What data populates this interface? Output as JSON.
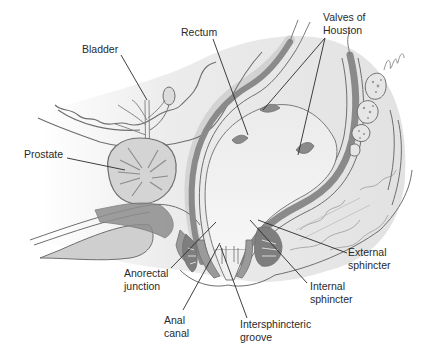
{
  "figure": {
    "type": "anatomical-illustration",
    "view": "sagittal section of male pelvis - rectum and anal canal",
    "colors": {
      "background": "#ffffff",
      "outline": "#6e6e6e",
      "soft_tissue": "#e6e6e6",
      "muscle_dark": "#8a8a8a",
      "muscle_mid": "#a8a8a8",
      "lumen": "#f2f2f2",
      "leader_line": "#2a2a2a",
      "label_text": "#2a2a2a"
    },
    "artist_signature": "signature"
  },
  "labels": {
    "bladder": "Bladder",
    "rectum": "Rectum",
    "valves_of_houston": "Valves of\nHouston",
    "prostate": "Prostate",
    "anorectal_junction": "Anorectal\njunction",
    "anal_canal": "Anal\ncanal",
    "intersphincteric_groove": "Intersphincteric\ngroove",
    "internal_sphincter": "Internal\nsphincter",
    "external_sphincter": "External\nsphincter"
  }
}
